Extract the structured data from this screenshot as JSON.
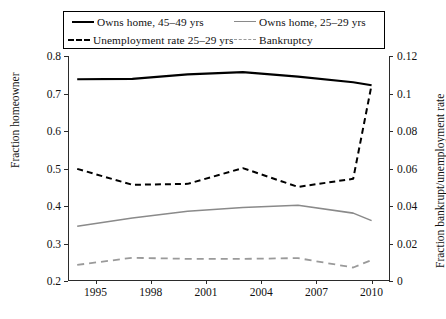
{
  "legend": {
    "items": [
      {
        "label": "Owns home, 45–49 yrs",
        "style": "solid-black",
        "name": "legend-owns-home-45-49"
      },
      {
        "label": "Owns home, 25–29 yrs",
        "style": "solid-gray",
        "name": "legend-owns-home-25-29"
      },
      {
        "label": "Unemployment rate 25–29 yrs",
        "style": "dash-black",
        "name": "legend-unemployment-25-29"
      },
      {
        "label": "Bankruptcy",
        "style": "dash-gray",
        "name": "legend-bankruptcy"
      }
    ]
  },
  "chart_data": {
    "type": "line",
    "title": "",
    "xlabel": "",
    "ylabel": "Fraction homeowner",
    "y2label": "Fraction bankrupt/unemployment rate",
    "grid": false,
    "legend_position": "top",
    "xlim": [
      1993.5,
      2011.0
    ],
    "ylim": [
      0.2,
      0.8
    ],
    "y2lim": [
      0.0,
      0.12
    ],
    "xticks": [
      1995,
      1998,
      2001,
      2004,
      2007,
      2010
    ],
    "xticklabels": [
      "1995",
      "1998",
      "2001",
      "2004",
      "2007",
      "2010"
    ],
    "yticks": [
      0.2,
      0.3,
      0.4,
      0.5,
      0.6,
      0.7,
      0.8
    ],
    "yticklabels": [
      "0.2",
      "0.3",
      "0.4",
      "0.5",
      "0.6",
      "0.7",
      "0.8"
    ],
    "y2ticks": [
      0,
      0.02,
      0.04,
      0.06,
      0.08,
      0.1,
      0.12
    ],
    "y2ticklabels": [
      "0",
      "0.02",
      "0.04",
      "0.06",
      "0.08",
      "0.1",
      "0.12"
    ],
    "x": [
      1994,
      1997,
      2000,
      2003,
      2006,
      2009,
      2010
    ],
    "series": [
      {
        "name": "Owns home, 45–49 yrs",
        "axis": "left",
        "color": "#000000",
        "dash": "none",
        "width": 2.2,
        "x": [
          1994,
          1997,
          2000,
          2003,
          2006,
          2009,
          2010
        ],
        "values": [
          0.738,
          0.739,
          0.751,
          0.757,
          0.745,
          0.73,
          0.722
        ]
      },
      {
        "name": "Owns home, 25–29 yrs",
        "axis": "left",
        "color": "#8a8a8a",
        "dash": "none",
        "width": 1.6,
        "x": [
          1994,
          1997,
          2000,
          2003,
          2006,
          2009,
          2010
        ],
        "values": [
          0.346,
          0.368,
          0.386,
          0.396,
          0.402,
          0.381,
          0.361
        ]
      },
      {
        "name": "Unemployment rate 25–29 yrs",
        "axis": "right",
        "color": "#000000",
        "dash": "dashed",
        "width": 2.0,
        "x": [
          1994,
          1997,
          2000,
          2003,
          2006,
          2009,
          2010
        ],
        "values": [
          0.0598,
          0.0513,
          0.0518,
          0.0602,
          0.0502,
          0.0545,
          0.1046
        ]
      },
      {
        "name": "Bankruptcy",
        "axis": "right",
        "color": "#9a9a9a",
        "dash": "dashed",
        "width": 1.8,
        "x": [
          1994,
          1997,
          2000,
          2003,
          2006,
          2009,
          2010
        ],
        "values": [
          0.0086,
          0.0124,
          0.0118,
          0.0118,
          0.0122,
          0.0072,
          0.0112
        ]
      }
    ]
  }
}
